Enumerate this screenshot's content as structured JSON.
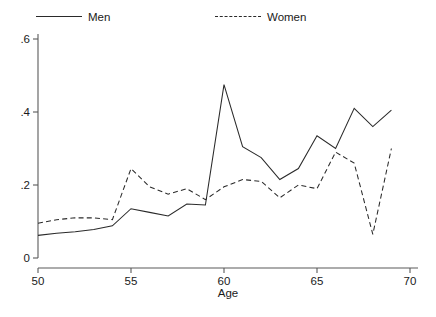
{
  "chart_data": {
    "type": "line",
    "title": "",
    "xlabel": "Age",
    "ylabel": "",
    "xlim": [
      50,
      70
    ],
    "ylim": [
      0,
      0.62
    ],
    "grid": false,
    "legend_position": "top",
    "xticks": [
      "50",
      "55",
      "60",
      "65",
      "70"
    ],
    "xtick_values": [
      50,
      55,
      60,
      65,
      70
    ],
    "yticks": [
      "0",
      ".2",
      ".4",
      ".6"
    ],
    "ytick_values": [
      0,
      0.2,
      0.4,
      0.6
    ],
    "x": [
      50,
      51,
      52,
      53,
      54,
      55,
      56,
      57,
      58,
      59,
      60,
      61,
      62,
      63,
      64,
      65,
      66,
      67,
      68,
      69
    ],
    "series": [
      {
        "name": "Men",
        "style": "solid",
        "color": "#2a2a2a",
        "values": [
          0.062,
          0.068,
          0.072,
          0.078,
          0.088,
          0.135,
          0.125,
          0.115,
          0.148,
          0.145,
          0.475,
          0.305,
          0.275,
          0.215,
          0.245,
          0.335,
          0.3,
          0.41,
          0.36,
          0.405
        ]
      },
      {
        "name": "Women",
        "style": "dashed",
        "color": "#2a2a2a",
        "values": [
          0.095,
          0.105,
          0.11,
          0.11,
          0.105,
          0.245,
          0.195,
          0.175,
          0.19,
          0.16,
          0.195,
          0.215,
          0.21,
          0.165,
          0.2,
          0.19,
          0.29,
          0.26,
          0.065,
          0.3
        ]
      }
    ]
  },
  "legend": {
    "men_label": "Men",
    "women_label": "Women"
  },
  "axes": {
    "x_title": "Age"
  }
}
